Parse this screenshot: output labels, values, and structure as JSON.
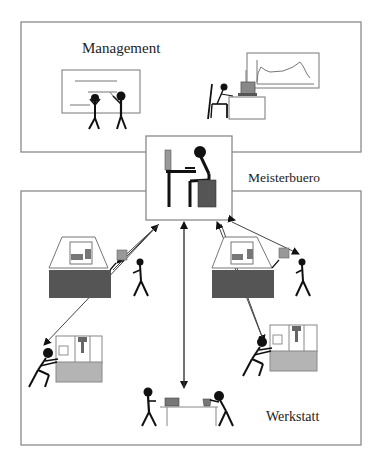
{
  "labels": {
    "management": "Management",
    "meisterbuero": "Meisterbuero",
    "werkstatt": "Werkstatt"
  },
  "colors": {
    "frame": "#8a8a8a",
    "ink": "#111111",
    "dark_fill": "#555555",
    "mid_fill": "#8c8c8c",
    "light_fill": "#b8b8b8"
  }
}
